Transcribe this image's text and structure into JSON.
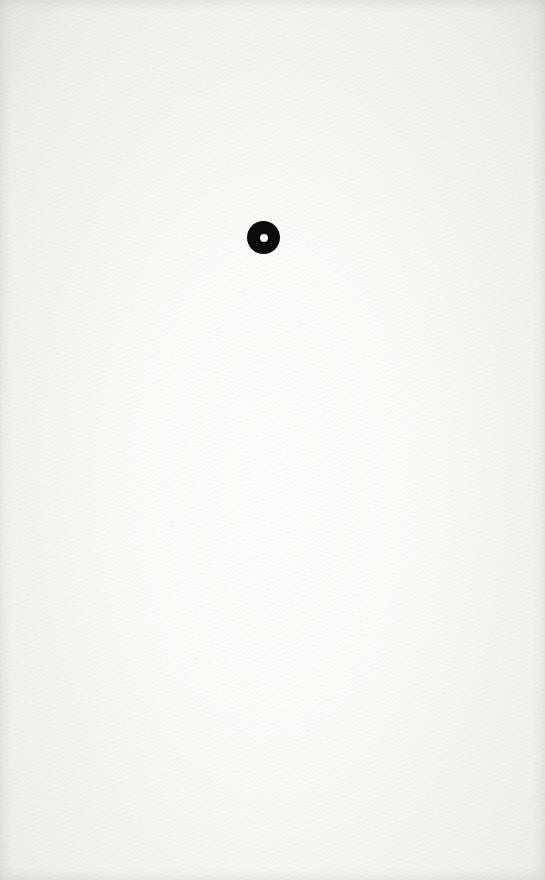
{
  "document": {
    "background": "paper-texture",
    "background_color": "#f6f6f5",
    "marks": [
      {
        "type": "ring-dot",
        "icon": "ring-icon",
        "color": "#0b0b0b",
        "center_color": "#f7f7f7",
        "center_x": 263,
        "center_y": 237,
        "diameter": 33
      }
    ]
  }
}
